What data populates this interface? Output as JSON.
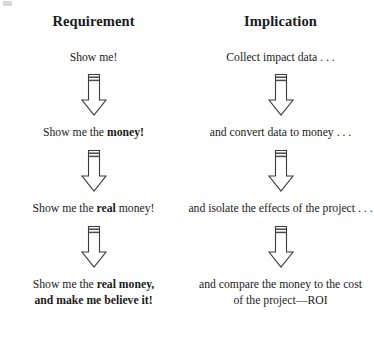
{
  "figure": {
    "title_left": "Requirement",
    "title_right": "Implication",
    "arrow_icon_name": "down-arrow-icon",
    "colors": {
      "background": "#ffffff",
      "text": "#1b1b1b",
      "arrow_stroke": "#3a3a3a",
      "arrow_fill": "#ffffff",
      "arrow_bar": "#4a4a4a"
    },
    "columns": [
      {
        "header": "Requirement",
        "steps": [
          {
            "plain": "Show me!",
            "segments": [
              {
                "text": "Show me!",
                "bold": false
              }
            ]
          },
          {
            "plain": "Show me the money!",
            "segments": [
              {
                "text": "Show me the ",
                "bold": false
              },
              {
                "text": "money!",
                "bold": true
              }
            ]
          },
          {
            "plain": "Show me the real money!",
            "segments": [
              {
                "text": "Show me the ",
                "bold": false
              },
              {
                "text": "real",
                "bold": true
              },
              {
                "text": " money!",
                "bold": false
              }
            ]
          },
          {
            "plain": "Show me the real money, and make me believe it!",
            "segments": [
              {
                "text": "Show me the ",
                "bold": false
              },
              {
                "text": "real money,",
                "bold": true
              },
              {
                "text": "\n",
                "bold": false
              },
              {
                "text": "and make me believe it!",
                "bold": true
              }
            ]
          }
        ]
      },
      {
        "header": "Implication",
        "steps": [
          {
            "plain": "Collect impact data . . .",
            "segments": [
              {
                "text": "Collect impact data . . .",
                "bold": false
              }
            ]
          },
          {
            "plain": "and convert data to money . . .",
            "segments": [
              {
                "text": "and convert data to money . . .",
                "bold": false
              }
            ]
          },
          {
            "plain": "and isolate the effects of the project . . .",
            "segments": [
              {
                "text": "and isolate the effects of the project . . .",
                "bold": false
              }
            ]
          },
          {
            "plain": "and compare the money to the cost of the project—ROI",
            "segments": [
              {
                "text": "and compare the money to the cost of the project—ROI",
                "bold": false
              }
            ]
          }
        ]
      }
    ],
    "arrow_count_per_column": 3
  },
  "chart_data": {
    "type": "table",
    "columns": [
      "Requirement",
      "Implication"
    ],
    "rows": [
      [
        "Show me!",
        "Collect impact data . . ."
      ],
      [
        "Show me the money!",
        "and convert data to money . . ."
      ],
      [
        "Show me the real money!",
        "and isolate the effects of the project . . ."
      ],
      [
        "Show me the real money, and make me believe it!",
        "and compare the money to the cost of the project—ROI"
      ]
    ],
    "flow_direction": "top-to-bottom",
    "connector": "down-arrow",
    "connector_count_per_column": 3
  }
}
